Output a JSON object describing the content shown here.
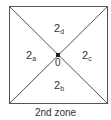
{
  "diagram": {
    "zones": {
      "top": {
        "base": "2",
        "sub": "d"
      },
      "left": {
        "base": "2",
        "sub": "a"
      },
      "right": {
        "base": "2",
        "sub": "c"
      },
      "bottom": {
        "base": "2",
        "sub": "b"
      }
    },
    "center_label": "0",
    "caption": "2nd zone",
    "colors": {
      "line": "#555555",
      "text": "#333333"
    }
  }
}
